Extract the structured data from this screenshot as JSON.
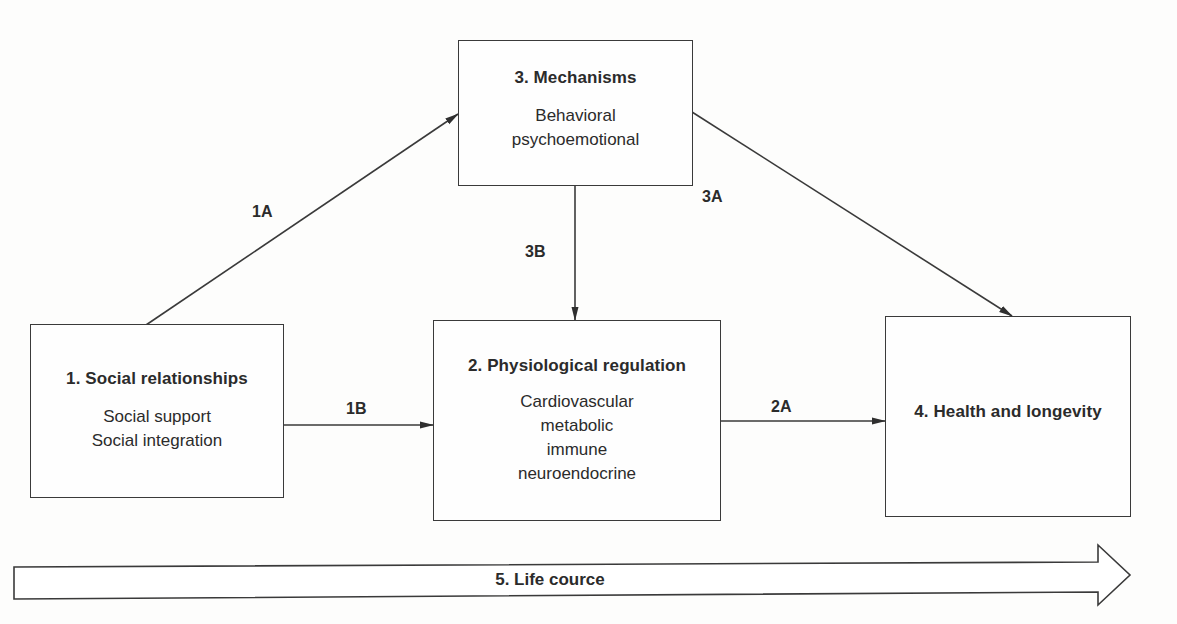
{
  "diagram": {
    "nodes": [
      {
        "id": "social-relationships",
        "title": "1. Social relationships",
        "lines": [
          "Social support",
          "Social integration"
        ]
      },
      {
        "id": "physiological-regulation",
        "title": "2. Physiological regulation",
        "lines": [
          "Cardiovascular",
          "metabolic",
          "immune",
          "neuroendocrine"
        ]
      },
      {
        "id": "mechanisms",
        "title": "3. Mechanisms",
        "lines": [
          "Behavioral",
          "psychoemotional"
        ]
      },
      {
        "id": "health-longevity",
        "title": "4. Health and longevity",
        "lines": []
      }
    ],
    "edges": [
      {
        "label": "1A",
        "from": "social-relationships",
        "to": "mechanisms"
      },
      {
        "label": "1B",
        "from": "social-relationships",
        "to": "physiological-regulation"
      },
      {
        "label": "2A",
        "from": "physiological-regulation",
        "to": "health-longevity"
      },
      {
        "label": "3A",
        "from": "mechanisms",
        "to": "health-longevity"
      },
      {
        "label": "3B",
        "from": "mechanisms",
        "to": "physiological-regulation"
      }
    ],
    "life_course": {
      "label": "5. Life cource"
    },
    "colors": {
      "stroke": "#3a3a3a",
      "text": "#2b2b2b",
      "background": "#fdfdfc"
    }
  }
}
